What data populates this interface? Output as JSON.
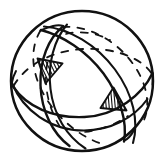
{
  "figure": {
    "style": "hand-drawn ink line art",
    "background_color": "#ffffff",
    "line_color": "#111111",
    "canvas": {
      "width": 164,
      "height": 162
    },
    "outer_circle": {
      "name": "sphere-outline",
      "center_x": 82,
      "center_y": 81,
      "radius_x": 71,
      "radius_y": 70
    },
    "great_circles": [
      {
        "name": "equatorial-band",
        "tilt_degrees": -8,
        "visible_arc": "front lower",
        "hidden_arc": "rear upper",
        "line_style": "solid-front-dashed-rear"
      },
      {
        "name": "tilted-band-left-leaning",
        "tilt_degrees": 58,
        "visible_arc": "front right",
        "hidden_arc": "rear left",
        "line_style": "solid-front-dashed-rear"
      },
      {
        "name": "tilted-band-right-leaning",
        "tilt_degrees": -58,
        "visible_arc": "front left",
        "hidden_arc": "rear right",
        "line_style": "solid-front-dashed-rear"
      }
    ],
    "shaded_regions": [
      {
        "name": "hatched-triangle-upper-left",
        "fill": "diagonal-hatching",
        "hatch_angle_degrees": 70,
        "hatch_count": 11,
        "bounds": {
          "x": 36,
          "y": 57,
          "width": 26,
          "height": 26
        }
      },
      {
        "name": "hatched-triangle-lower-right",
        "fill": "diagonal-hatching",
        "hatch_angle_degrees": 88,
        "hatch_count": 11,
        "bounds": {
          "x": 100,
          "y": 87,
          "width": 26,
          "height": 26
        }
      }
    ],
    "labels": {
      "caption": "",
      "alt_text": "Line drawing of a sphere crossed by three great circles forming interlocking rings, with two small triangular regions filled with diagonal hatching."
    }
  }
}
